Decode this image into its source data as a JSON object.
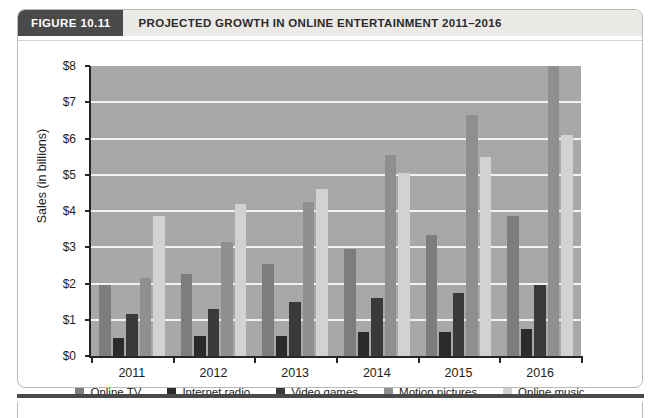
{
  "figure": {
    "number_label": "FIGURE 10.11",
    "title": "PROJECTED GROWTH IN ONLINE ENTERTAINMENT 2011–2016"
  },
  "colors": {
    "plot_background": "#a8a8a8",
    "gridline": "#f2f2f2",
    "axis": "#262626",
    "header_number_bg": "#4a4a4a",
    "header_title_bg": "#eceae7",
    "series_online_tv": "#7d7d7d",
    "series_internet_radio": "#2b2b2b",
    "series_video_games": "#3a3a3a",
    "series_motion_pictures": "#8f8f8f",
    "series_online_music": "#d2d2d2"
  },
  "chart_data": {
    "type": "bar",
    "title": "PROJECTED GROWTH IN ONLINE ENTERTAINMENT 2011–2016",
    "xlabel": "",
    "ylabel": "Sales (in billions)",
    "categories": [
      "2011",
      "2012",
      "2013",
      "2014",
      "2015",
      "2016"
    ],
    "ylim": [
      0,
      8
    ],
    "yticks": [
      0,
      1,
      2,
      3,
      4,
      5,
      6,
      7,
      8
    ],
    "ytick_labels": [
      "$0",
      "$1",
      "$2",
      "$3",
      "$4",
      "$5",
      "$6",
      "$7",
      "$8"
    ],
    "grid": true,
    "legend_position": "bottom",
    "series": [
      {
        "name": "Online TV",
        "color": "#7d7d7d",
        "values": [
          1.95,
          2.25,
          2.55,
          2.95,
          3.35,
          3.85
        ]
      },
      {
        "name": "Internet radio",
        "color": "#2b2b2b",
        "values": [
          0.5,
          0.55,
          0.55,
          0.65,
          0.65,
          0.75
        ]
      },
      {
        "name": "Video games",
        "color": "#3a3a3a",
        "values": [
          1.15,
          1.3,
          1.5,
          1.6,
          1.75,
          1.95
        ]
      },
      {
        "name": "Motion pictures",
        "color": "#8f8f8f",
        "values": [
          2.15,
          3.15,
          4.25,
          5.55,
          6.65,
          8.0
        ]
      },
      {
        "name": "Online music",
        "color": "#d2d2d2",
        "values": [
          3.85,
          4.2,
          4.6,
          5.05,
          5.5,
          6.1
        ]
      }
    ]
  }
}
